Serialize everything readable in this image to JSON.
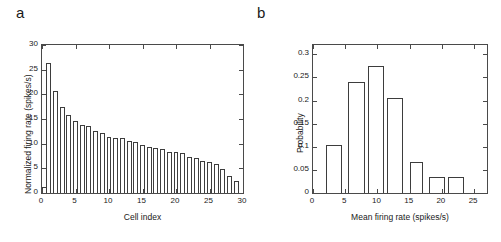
{
  "figure": {
    "panels": [
      {
        "label": "a",
        "xlabel": "Cell index",
        "ylabel": "Normalized firing rate (spikes/s)",
        "xticks": [
          "0",
          "5",
          "10",
          "15",
          "20",
          "25",
          "30"
        ],
        "yticks": [
          "0",
          "5",
          "10",
          "15",
          "20",
          "25",
          "30"
        ]
      },
      {
        "label": "b",
        "xlabel": "Mean firing rate (spikes/s)",
        "ylabel": "Probability",
        "xticks": [
          "0",
          "5",
          "10",
          "15",
          "20",
          "25"
        ],
        "yticks": [
          "0",
          "0.05",
          "0.1",
          "0.15",
          "0.2",
          "0.25",
          "0.3"
        ]
      }
    ]
  },
  "chart_data": [
    {
      "type": "bar",
      "title": "a",
      "xlabel": "Cell index",
      "ylabel": "Normalized firing rate (spikes/s)",
      "xlim": [
        0,
        30
      ],
      "ylim": [
        0,
        30
      ],
      "xticks": [
        0,
        5,
        10,
        15,
        20,
        25,
        30
      ],
      "yticks": [
        0,
        5,
        10,
        15,
        20,
        25,
        30
      ],
      "grid": false,
      "legend": null,
      "categories": [
        1,
        2,
        3,
        4,
        5,
        6,
        7,
        8,
        9,
        10,
        11,
        12,
        13,
        14,
        15,
        16,
        17,
        18,
        19,
        20,
        21,
        22,
        23,
        24,
        25,
        26,
        27,
        28,
        29
      ],
      "values": [
        26.3,
        20.6,
        17.4,
        15.8,
        14.6,
        13.8,
        13.6,
        12.6,
        12.2,
        11.4,
        11.2,
        11.1,
        10.5,
        10.4,
        9.8,
        9.4,
        9.1,
        9.0,
        8.4,
        8.3,
        8.1,
        7.3,
        7.0,
        6.5,
        6.3,
        5.9,
        4.8,
        3.5,
        2.4,
        1.2
      ],
      "bar_fill": "#ffffff",
      "bar_edge": "#3d3d3d"
    },
    {
      "type": "bar",
      "title": "b",
      "xlabel": "Mean firing rate (spikes/s)",
      "ylabel": "Probability",
      "xlim": [
        0,
        27
      ],
      "ylim": [
        0,
        0.32
      ],
      "xticks": [
        0,
        5,
        10,
        15,
        20,
        25
      ],
      "yticks": [
        0,
        0.05,
        0.1,
        0.15,
        0.2,
        0.25,
        0.3
      ],
      "grid": false,
      "legend": null,
      "bin_edges": [
        2,
        4.5,
        5.5,
        8,
        8.5,
        11,
        11.5,
        14,
        15,
        17,
        18,
        20.5,
        21,
        23.5,
        24,
        26
      ],
      "bin_centers": [
        3.2,
        6.7,
        9.7,
        12.7,
        16,
        19.2,
        25
      ],
      "categories": [
        "2-4.5",
        "5.5-8",
        "8.5-11",
        "11.5-14",
        "15-17",
        "18-20.5",
        "24-26"
      ],
      "values": [
        0.103,
        0.241,
        0.275,
        0.206,
        0.068,
        0.034,
        0.034
      ],
      "bar_fill": "#ffffff",
      "bar_edge": "#3d3d3d"
    }
  ]
}
